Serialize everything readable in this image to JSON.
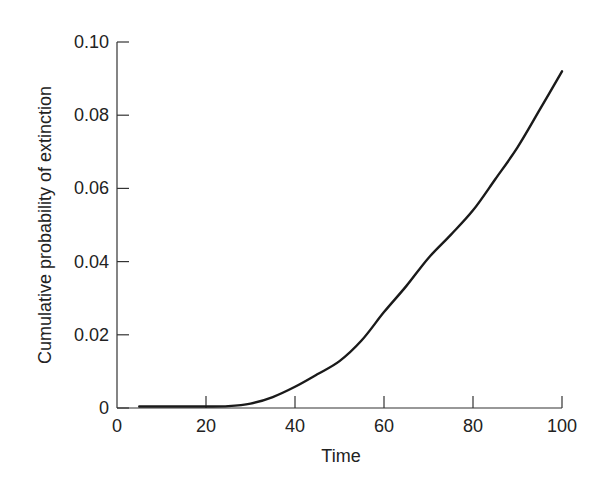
{
  "chart_data": {
    "type": "line",
    "title": "",
    "xlabel": "Time",
    "ylabel": "Cumulative probability of extinction",
    "xlim": [
      0,
      100
    ],
    "ylim": [
      0,
      0.1
    ],
    "x_ticks": [
      0,
      20,
      40,
      60,
      80,
      100
    ],
    "x_tick_labels": [
      "0",
      "20",
      "40",
      "60",
      "80",
      "100"
    ],
    "y_ticks": [
      0,
      0.02,
      0.04,
      0.06,
      0.08,
      0.1
    ],
    "y_tick_labels": [
      "0",
      "0.02",
      "0.04",
      "0.06",
      "0.08",
      "0.10"
    ],
    "grid": false,
    "legend": null,
    "series": [
      {
        "name": "Cumulative probability of extinction",
        "color": "#1a1a1a",
        "x": [
          5,
          10,
          15,
          20,
          25,
          30,
          35,
          40,
          45,
          50,
          55,
          60,
          65,
          70,
          75,
          80,
          85,
          90,
          95,
          100
        ],
        "y": [
          0.0004,
          0.0004,
          0.0004,
          0.0004,
          0.0005,
          0.0012,
          0.003,
          0.0058,
          0.0092,
          0.0128,
          0.0185,
          0.0262,
          0.0333,
          0.041,
          0.0473,
          0.054,
          0.0625,
          0.0712,
          0.0815,
          0.092
        ]
      }
    ]
  }
}
